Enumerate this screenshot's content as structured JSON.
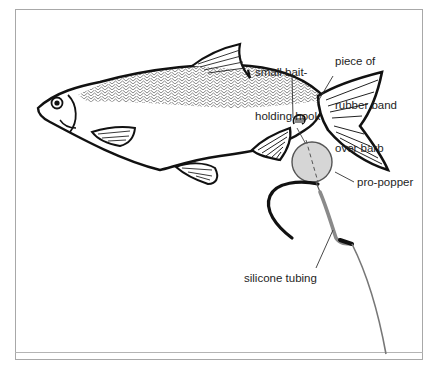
{
  "diagram": {
    "colors": {
      "outline": "#111111",
      "popper_fill": "#d6d6d6",
      "popper_stroke": "#555555",
      "tubing": "#8a8a8a",
      "line": "#777777",
      "frame": "#a8a8a8",
      "leader": "#333333"
    },
    "labels": {
      "bait_hook": {
        "line1": "small bait-",
        "line2": "holding hook"
      },
      "rubber_band": {
        "line1": "piece of",
        "line2": "rubber band",
        "line3": "over barb"
      },
      "pro_popper": "pro-popper",
      "silicone_tubing": "silicone tubing"
    },
    "components": [
      {
        "name": "fish",
        "icon": "fish-illustration"
      },
      {
        "name": "small bait-holding hook",
        "icon": "small-hook"
      },
      {
        "name": "piece of rubber band over barb",
        "icon": "rubber-band"
      },
      {
        "name": "pro-popper",
        "icon": "grey-circle"
      },
      {
        "name": "main hook",
        "icon": "hook"
      },
      {
        "name": "silicone tubing",
        "icon": "tubing-segment"
      },
      {
        "name": "fishing line",
        "icon": "line"
      }
    ]
  }
}
